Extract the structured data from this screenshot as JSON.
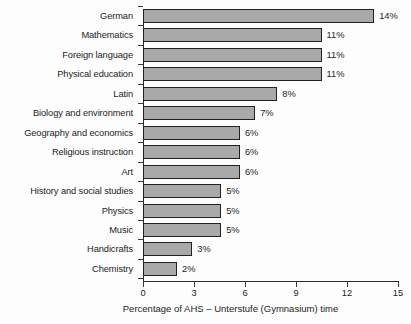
{
  "chart_data": {
    "type": "bar",
    "orientation": "horizontal",
    "title": "",
    "xlabel": "Percentage of AHS – Unterstufe (Gymnasium) time",
    "ylabel": "",
    "xlim": [
      0,
      15
    ],
    "xticks": [
      0,
      3,
      6,
      9,
      12,
      15
    ],
    "xtick_labels": [
      "0",
      "3",
      "6",
      "9",
      "12",
      "15"
    ],
    "grid": false,
    "legend": false,
    "bar_color": "#a9a9a9",
    "bar_edge_color": "#222222",
    "categories": [
      "German",
      "Mathematics",
      "Foreign language",
      "Physical education",
      "Latin",
      "Biology and environment",
      "Geography and economics",
      "Religious instruction",
      "Art",
      "History and social studies",
      "Physics",
      "Music",
      "Handicrafts",
      "Chemistry"
    ],
    "values": [
      13.6,
      10.5,
      10.5,
      10.5,
      7.9,
      6.6,
      5.7,
      5.7,
      5.7,
      4.6,
      4.6,
      4.6,
      2.9,
      2.0
    ],
    "data_labels": [
      "14%",
      "11%",
      "11%",
      "11%",
      "8%",
      "7%",
      "6%",
      "6%",
      "6%",
      "5%",
      "5%",
      "5%",
      "3%",
      "2%"
    ]
  }
}
